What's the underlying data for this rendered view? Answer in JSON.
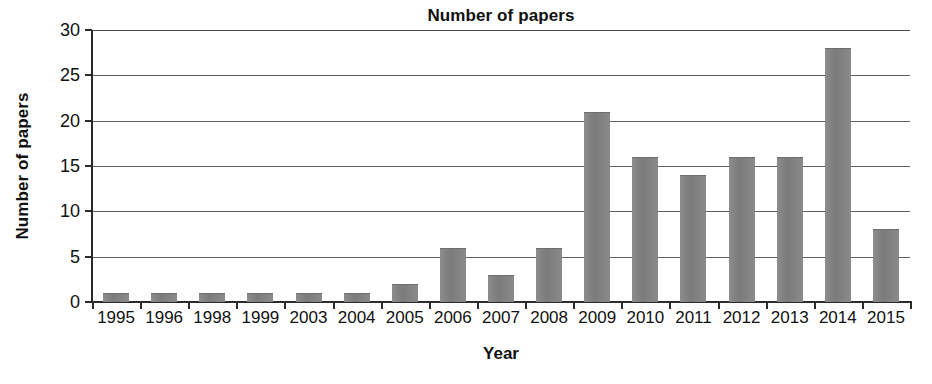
{
  "chart_data": {
    "type": "bar",
    "title": "Number of papers",
    "xlabel": "Year",
    "ylabel": "Number of papers",
    "categories": [
      "1995",
      "1996",
      "1998",
      "1999",
      "2003",
      "2004",
      "2005",
      "2006",
      "2007",
      "2008",
      "2009",
      "2010",
      "2011",
      "2012",
      "2013",
      "2014",
      "2015"
    ],
    "values": [
      1,
      1,
      1,
      1,
      1,
      1,
      2,
      6,
      3,
      6,
      21,
      16,
      14,
      16,
      16,
      28,
      8
    ],
    "series": [
      {
        "name": "Number of papers",
        "values": [
          1,
          1,
          1,
          1,
          1,
          1,
          2,
          6,
          3,
          6,
          21,
          16,
          14,
          16,
          16,
          28,
          8
        ]
      }
    ],
    "ylim": [
      0,
      30
    ],
    "ytick_step": 5,
    "yticks": [
      0,
      5,
      10,
      15,
      20,
      25,
      30
    ],
    "ytick_labels": [
      "0",
      "5",
      "10",
      "15",
      "20",
      "25",
      "30"
    ],
    "grid": true,
    "grid_axis": "y",
    "legend": false,
    "legend_position": "none",
    "bar_color": "#808080",
    "gridline_color": "#5e5e5e",
    "axis_color": "#2b2b2b",
    "background_color": "#ffffff"
  }
}
